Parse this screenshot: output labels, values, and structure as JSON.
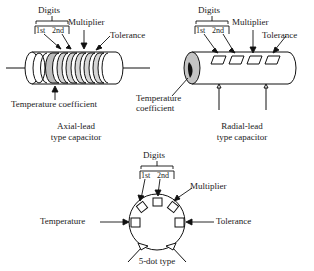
{
  "figure": {
    "ink_color": "#111111",
    "band_fill": "#c9c9c9",
    "body_fill": "#ffffff"
  },
  "axial": {
    "digits_label": "Digits",
    "first_digit_label": "1st",
    "second_digit_label": "2nd",
    "multiplier_label": "Multiplier",
    "tolerance_label": "Tolerance",
    "temp_coefficient_label": "Temperature coefficient",
    "caption_line1": "Axial-lead",
    "caption_line2": "type capacitor"
  },
  "radial": {
    "digits_label": "Digits",
    "first_digit_label": "1st",
    "second_digit_label": "2nd",
    "multiplier_label": "Multiplier",
    "tolerance_label": "Tolerance",
    "temp_coefficient_line1": "Temperature",
    "temp_coefficient_line2": "coefficient",
    "caption_line1": "Radial-lead",
    "caption_line2": "type capacitor"
  },
  "five_dot": {
    "digits_label": "Digits",
    "first_digit_label": "1st",
    "second_digit_label": "2nd",
    "multiplier_label": "Multiplier",
    "tolerance_label": "Tolerance",
    "temperature_label": "Temperature",
    "caption": "5-dot type"
  }
}
